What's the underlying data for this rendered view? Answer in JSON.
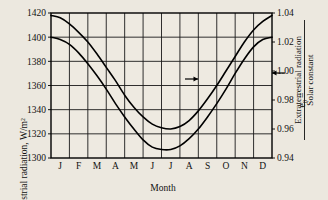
{
  "chart_data": {
    "type": "line",
    "title": "",
    "xlabel": "Month",
    "ylabel": "Extraterrestrial radiation, W/m²",
    "y2label_symbol": "e",
    "y2label_subscript": "0",
    "y2label_equals": "=",
    "y2label_numerator": "Extraterrestrial radiation",
    "y2label_denominator": "Solar constant",
    "grid": true,
    "legend": "none",
    "categories": [
      "J",
      "F",
      "M",
      "A",
      "M",
      "J",
      "J",
      "A",
      "S",
      "O",
      "N",
      "D"
    ],
    "x_tick_labels": [
      "J",
      "F",
      "M",
      "A",
      "M",
      "J",
      "J",
      "A",
      "S",
      "O",
      "N",
      "D"
    ],
    "ylim": [
      1300,
      1420
    ],
    "y_tick_labels": [
      "1300",
      "1320",
      "1340",
      "1360",
      "1380",
      "1400",
      "1420"
    ],
    "y_ticks": [
      1300,
      1320,
      1340,
      1360,
      1380,
      1400,
      1420
    ],
    "y2lim": [
      0.94,
      1.04
    ],
    "y2_tick_labels": [
      "0.94",
      "0.96",
      "0.98",
      "1.00",
      "1.02",
      "1.04"
    ],
    "y2_ticks": [
      0.94,
      0.96,
      0.98,
      1.0,
      1.02,
      1.04
    ],
    "series": [
      {
        "name": "upper-curve",
        "axis": "right",
        "x": [
          0.0,
          0.5,
          1.0,
          1.5,
          2.0,
          2.5,
          3.0,
          3.5,
          4.0,
          4.5,
          5.0,
          5.5,
          6.0,
          6.5,
          7.0,
          7.5,
          8.0,
          8.5,
          9.0,
          9.5,
          10.0,
          10.5,
          11.0,
          11.5,
          12.0
        ],
        "values": [
          1418,
          1416,
          1411,
          1404,
          1396,
          1386,
          1375,
          1364,
          1352,
          1342,
          1334,
          1328,
          1325,
          1324,
          1326,
          1331,
          1339,
          1349,
          1360,
          1372,
          1384,
          1396,
          1406,
          1413,
          1418
        ]
      },
      {
        "name": "lower-curve",
        "axis": "left",
        "x": [
          0.0,
          0.5,
          1.0,
          1.5,
          2.0,
          2.5,
          3.0,
          3.5,
          4.0,
          4.5,
          5.0,
          5.5,
          6.0,
          6.5,
          7.0,
          7.5,
          8.0,
          8.5,
          9.0,
          9.5,
          10.0,
          10.5,
          11.0,
          11.5,
          12.0
        ],
        "values": [
          1400,
          1398,
          1394,
          1387,
          1378,
          1368,
          1357,
          1345,
          1334,
          1324,
          1315,
          1309,
          1307,
          1307,
          1310,
          1316,
          1324,
          1334,
          1345,
          1357,
          1370,
          1382,
          1392,
          1398,
          1400
        ]
      }
    ],
    "annotations": [
      {
        "name": "arrow-to-left-axis-curve",
        "direction": "right",
        "glyph": "→",
        "x_px": 198,
        "y_px": 79
      },
      {
        "name": "arrow-to-right-axis-curve",
        "direction": "left",
        "glyph": "←",
        "x_px": 272,
        "y_px": 73
      }
    ],
    "colors": {
      "background": "#ece8df",
      "plot_background": "#eeeae1",
      "grid": "#1a1a1a",
      "curve": "#000000",
      "axis": "#000000",
      "text": "#111111"
    }
  }
}
